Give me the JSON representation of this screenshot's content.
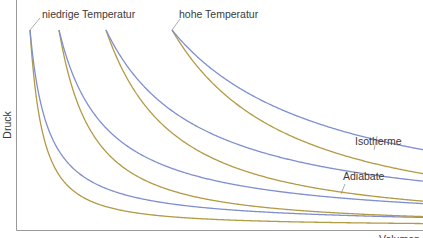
{
  "diagram": {
    "labels": {
      "low_temperature": "niedrige Temperatur",
      "high_temperature": "hohe Temperatur",
      "isotherm": "Isotherme",
      "adiabat": "Adiabate",
      "y_axis": "Druck",
      "x_axis": "Volumen"
    },
    "colors": {
      "isotherm": "#7f8fcf",
      "adiabat": "#b39a45",
      "axis": "#9a9a9a",
      "text": "#3a3a3a"
    },
    "curve_pairs": 4,
    "adiabatic_exponent": 1.4
  }
}
